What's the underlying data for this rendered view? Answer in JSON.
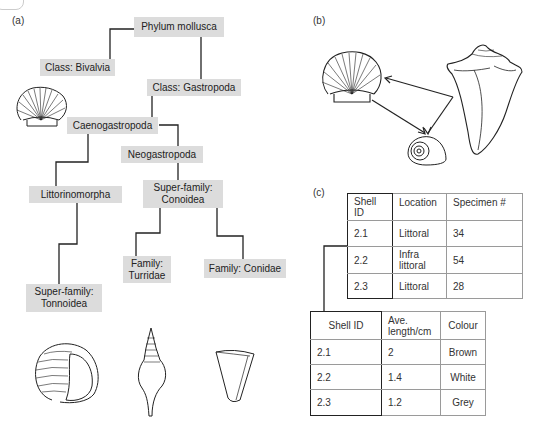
{
  "panels": {
    "a": {
      "label": "(a)"
    },
    "b": {
      "label": "(b)"
    },
    "c": {
      "label": "(c)"
    }
  },
  "taxonomy": {
    "phylum": "Phylum mollusca",
    "bivalvia": "Class: Bivalvia",
    "gastropoda": "Class: Gastropoda",
    "caenogastropoda": "Caenogastropoda",
    "neogastropoda": "Neogastropoda",
    "littorinomorpha": "Littorinomorpha",
    "conoidea": "Super-family:\nConoidea",
    "tonnoidea": "Super-family:\nTonnoidea",
    "turridae": "Family:\nTurridae",
    "conidae": "Family: Conidae"
  },
  "illustrations": {
    "a": [
      "scallop-shell",
      "tun-shell",
      "turrid-shell",
      "cone-shell"
    ],
    "b": [
      "scallop-shell",
      "conch-shell",
      "snail-shell"
    ]
  },
  "table1": {
    "headers": [
      "Shell\nID",
      "Location",
      "Specimen #"
    ],
    "rows": [
      [
        "2.1",
        "Littoral",
        "34"
      ],
      [
        "2.2",
        "Infra\nlittoral",
        "54"
      ],
      [
        "2.3",
        "Littoral",
        "28"
      ]
    ]
  },
  "table2": {
    "headers": [
      "Shell ID",
      "Ave.\nlength/cm",
      "Colour"
    ],
    "rows": [
      [
        "2.1",
        "2",
        "Brown"
      ],
      [
        "2.2",
        "1.4",
        "White"
      ],
      [
        "2.3",
        "1.2",
        "Grey"
      ]
    ]
  },
  "colors": {
    "node_fill": "#dcdcdc",
    "line": "#222222",
    "table_border": "#9a9a9a"
  }
}
